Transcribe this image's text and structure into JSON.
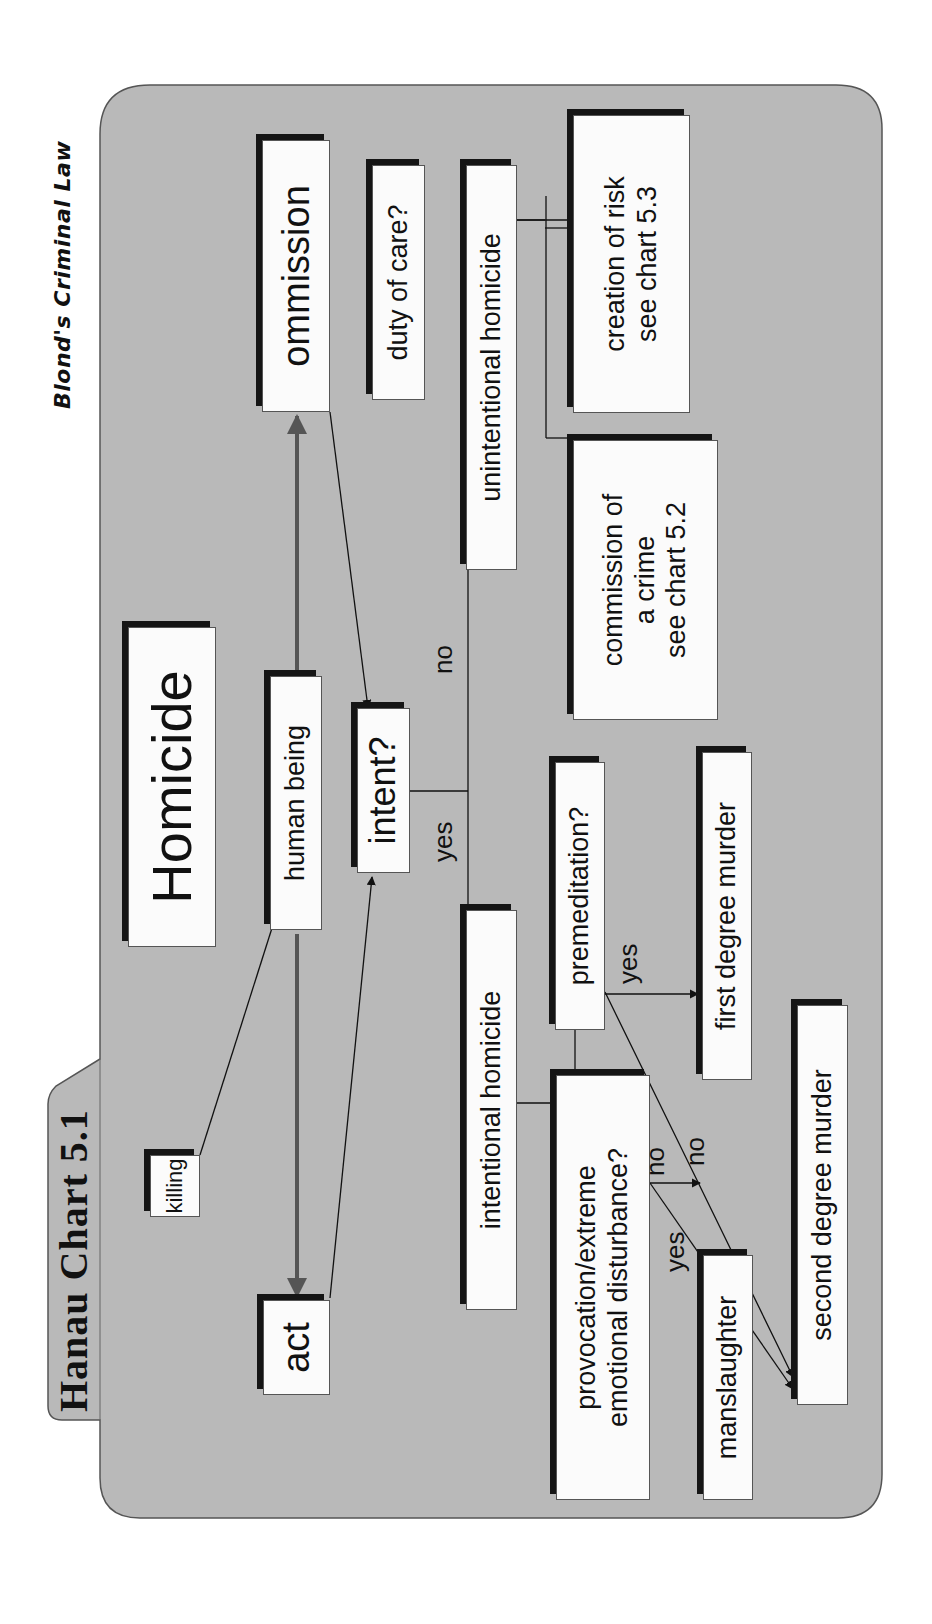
{
  "header": {
    "title": "Hanau Chart 5.1",
    "subtitle": "Blond's Criminal Law"
  },
  "colors": {
    "panel": "#b9b9b9",
    "box_fill": "#fbfbfb",
    "box_shadow": "#151515",
    "arrow_gray": "#555555",
    "line": "#111111"
  },
  "nodes": {
    "homicide": "Homicide",
    "killing": "killing",
    "human_being": "human being",
    "act": "act",
    "ommission": "ommission",
    "duty_of_care": "duty of care?",
    "intent": "intent?",
    "intentional_homicide": "intentional homicide",
    "unintentional_homicide": "unintentional homicide",
    "premeditation": "premeditation?",
    "provocation": "provocation/extreme\nemotional disturbance?",
    "first_degree": "first degree murder",
    "second_degree": "second degree murder",
    "manslaughter": "manslaughter",
    "commission_of_crime": "commission of\na crime\nsee chart 5.2",
    "creation_of_risk": "creation of risk\nsee chart 5.3"
  },
  "edge_labels": {
    "intent_yes": "yes",
    "intent_no": "no",
    "premeditation_yes": "yes",
    "premeditation_no": "no",
    "provocation_yes": "yes",
    "provocation_no": "no"
  }
}
